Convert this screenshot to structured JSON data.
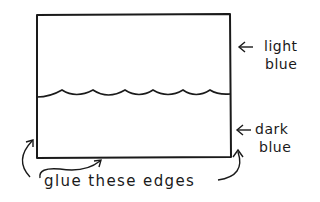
{
  "diagram": {
    "type": "craft-instruction-sketch",
    "panel": {
      "upper_region_label": "light blue",
      "lower_region_label": "dark blue",
      "divider": "wavy line"
    },
    "labels": {
      "light_line1": "light",
      "light_line2": "blue",
      "dark_line1": "dark",
      "dark_line2": "blue",
      "glue": "glue these edges"
    },
    "arrows": {
      "light_arrow": "left-arrow",
      "dark_arrow": "left-arrow",
      "glue_left": "curved-arrow-up",
      "glue_bottom": "curved-arrow-up",
      "glue_right": "curved-arrow-up"
    },
    "colors": {
      "ink": "#1a1a1a",
      "background": "#ffffff"
    }
  }
}
